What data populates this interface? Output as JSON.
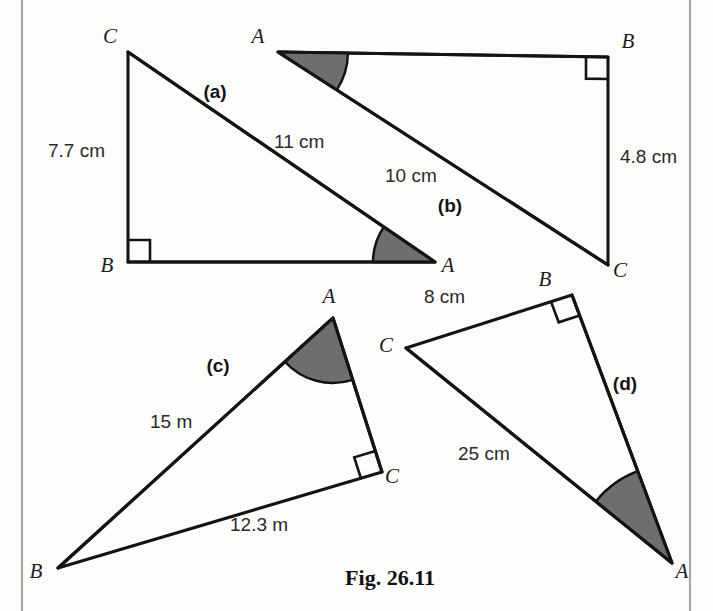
{
  "figure": {
    "caption": "Fig. 26.11",
    "page_colors": {
      "background": "#fdfdfc",
      "ink": "#141414",
      "shaded_angle_fill": "#6e6e6e",
      "margin_rule": "#a9a9a9"
    },
    "margin_rules": {
      "left_x": 22,
      "right_x": 690
    }
  },
  "triangles": [
    {
      "id": "a",
      "part_label": "(a)",
      "part_label_pos": {
        "x": 215,
        "y": 98
      },
      "vertices": {
        "A": {
          "x": 435,
          "y": 262,
          "label": "A",
          "label_pos": {
            "x": 448,
            "y": 272
          }
        },
        "B": {
          "x": 128,
          "y": 262,
          "label": "B",
          "label_pos": {
            "x": 107,
            "y": 272
          }
        },
        "C": {
          "x": 128,
          "y": 52,
          "label": "C",
          "label_pos": {
            "x": 110,
            "y": 43
          }
        }
      },
      "side_labels": [
        {
          "name": "side-bc",
          "text": "7.7 cm",
          "x": 48,
          "y": 157
        },
        {
          "name": "side-ca",
          "text": "11 cm",
          "x": 274,
          "y": 148
        }
      ],
      "right_angle_at": "B",
      "shaded_angle_at": "A",
      "shaded_angle_radius": 62
    },
    {
      "id": "b",
      "part_label": "(b)",
      "part_label_pos": {
        "x": 450,
        "y": 212
      },
      "vertices": {
        "A": {
          "x": 278,
          "y": 52,
          "label": "A",
          "label_pos": {
            "x": 258,
            "y": 43
          }
        },
        "B": {
          "x": 608,
          "y": 57,
          "label": "B",
          "label_pos": {
            "x": 628,
            "y": 48
          }
        },
        "C": {
          "x": 608,
          "y": 265,
          "label": "C",
          "label_pos": {
            "x": 620,
            "y": 277
          }
        }
      },
      "side_labels": [
        {
          "name": "side-bc",
          "text": "4.8 cm",
          "x": 620,
          "y": 163
        },
        {
          "name": "side-ac",
          "text": "10 cm",
          "x": 385,
          "y": 182
        }
      ],
      "right_angle_at": "B",
      "shaded_angle_at": "A",
      "shaded_angle_radius": 70
    },
    {
      "id": "c",
      "part_label": "(c)",
      "part_label_pos": {
        "x": 218,
        "y": 372
      },
      "vertices": {
        "A": {
          "x": 333,
          "y": 318,
          "label": "A",
          "label_pos": {
            "x": 329,
            "y": 303
          }
        },
        "B": {
          "x": 58,
          "y": 568,
          "label": "B",
          "label_pos": {
            "x": 36,
            "y": 578
          }
        },
        "C": {
          "x": 382,
          "y": 472,
          "label": "C",
          "label_pos": {
            "x": 392,
            "y": 483
          }
        }
      },
      "side_labels": [
        {
          "name": "side-ab",
          "text": "15 m",
          "x": 150,
          "y": 428
        },
        {
          "name": "side-bc",
          "text": "12.3 m",
          "x": 230,
          "y": 531
        }
      ],
      "right_angle_at": "C",
      "shaded_angle_at": "A",
      "shaded_angle_radius": 65
    },
    {
      "id": "d",
      "part_label": "(d)",
      "part_label_pos": {
        "x": 625,
        "y": 390
      },
      "vertices": {
        "A": {
          "x": 672,
          "y": 563,
          "label": "A",
          "label_pos": {
            "x": 682,
            "y": 578
          }
        },
        "B": {
          "x": 572,
          "y": 295,
          "label": "B",
          "label_pos": {
            "x": 545,
            "y": 286
          }
        },
        "C": {
          "x": 406,
          "y": 348,
          "label": "C",
          "label_pos": {
            "x": 386,
            "y": 352
          }
        }
      },
      "side_labels": [
        {
          "name": "side-bc",
          "text": "8 cm",
          "x": 424,
          "y": 303
        },
        {
          "name": "side-ca",
          "text": "25 cm",
          "x": 458,
          "y": 460
        }
      ],
      "right_angle_at": "B",
      "shaded_angle_at": "A",
      "shaded_angle_radius": 98
    }
  ]
}
